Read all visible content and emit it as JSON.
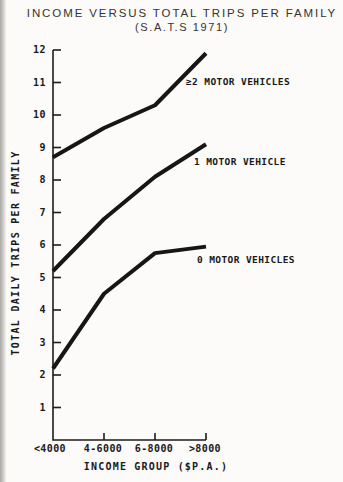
{
  "page": {
    "title": "INCOME VERSUS TOTAL TRIPS PER FAMILY",
    "subtitle": "(S.A.T.S 1971)"
  },
  "chart_data": {
    "type": "line",
    "title": "INCOME VERSUS TOTAL TRIPS PER FAMILY",
    "subtitle": "(S.A.T.S 1971)",
    "categories": [
      "<4000",
      "4-6000",
      "6-8000",
      ">8000"
    ],
    "xlabel": "INCOME GROUP ($P.A.)",
    "ylabel": "TOTAL DAILY TRIPS PER FAMILY",
    "ylim": [
      0,
      12
    ],
    "yticks": [
      1,
      2,
      3,
      4,
      5,
      6,
      7,
      8,
      9,
      10,
      11,
      12
    ],
    "grid": false,
    "legend_position": "inline-right-of-lines",
    "series": [
      {
        "name": "≥2 MOTOR VEHICLES",
        "values": [
          8.7,
          9.6,
          10.3,
          11.9
        ]
      },
      {
        "name": "1 MOTOR VEHICLE",
        "values": [
          5.2,
          6.8,
          8.1,
          9.1
        ]
      },
      {
        "name": "0 MOTOR VEHICLES",
        "values": [
          2.2,
          4.5,
          5.75,
          5.95
        ]
      }
    ],
    "line_color": "#161616",
    "axis_color": "#1c1c1c",
    "line_width": 4
  }
}
